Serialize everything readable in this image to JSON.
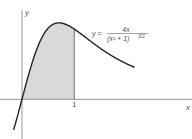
{
  "chart_data": {
    "type": "area",
    "title": "",
    "xlabel": "x",
    "ylabel": "y",
    "x_ticks": [
      {
        "value": 1,
        "label": "1"
      }
    ],
    "xlim": [
      -0.42,
      3.25
    ],
    "ylim": [
      -0.8,
      2.0
    ],
    "function": {
      "expression": "4x/(x^2+1)^(3/2)",
      "domain": [
        -0.16,
        2.15
      ]
    },
    "shaded_region": {
      "from": 0,
      "to": 1,
      "color": "#d9d9d9"
    },
    "equation_label": {
      "lhs": "y =",
      "numerator": "4x",
      "denominator": "(x² + 1)",
      "exponent": "3/2"
    },
    "curve_color": "#222222",
    "axis_color": "#999999",
    "grid": false
  }
}
